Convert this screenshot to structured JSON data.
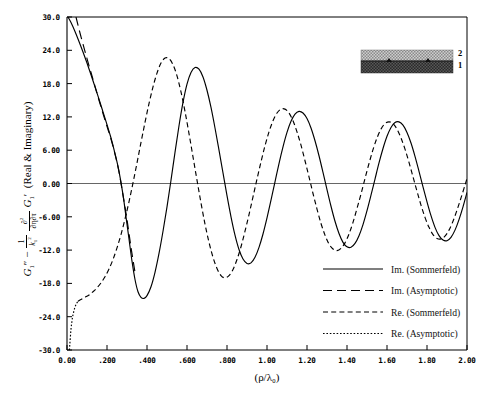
{
  "chart_data": {
    "type": "line",
    "title": "",
    "xlabel": "(ρ/λ₀)",
    "ylabel": "G₁″ − (1/k₁²)(∂²/∂η∂τ) G₁′  (Real & Imaginary)",
    "xlim": [
      0.0,
      2.0
    ],
    "ylim": [
      -30.0,
      30.0
    ],
    "grid": false,
    "legend_position": "lower-right-inside",
    "xticks": [
      "0.00",
      ".200",
      ".400",
      ".600",
      ".800",
      "1.00",
      "1.20",
      "1.40",
      "1.60",
      "1.80",
      "2.00"
    ],
    "xtick_values": [
      0.0,
      0.2,
      0.4,
      0.6,
      0.8,
      1.0,
      1.2,
      1.4,
      1.6,
      1.8,
      2.0
    ],
    "yticks": [
      "30.0",
      "24.0",
      "18.0",
      "12.0",
      "6.00",
      "0.00",
      "-6.00",
      "-12.0",
      "-18.0",
      "-24.0",
      "-30.0"
    ],
    "ytick_values": [
      30.0,
      24.0,
      18.0,
      12.0,
      6.0,
      0.0,
      -6.0,
      -12.0,
      -18.0,
      -24.0,
      -30.0
    ],
    "zero_line": 0.0,
    "series": [
      {
        "name": "Im. (Sommerfeld)",
        "style": "solid",
        "points": [
          [
            0.005,
            30.0
          ],
          [
            0.02,
            29.0
          ],
          [
            0.04,
            27.4
          ],
          [
            0.06,
            25.6
          ],
          [
            0.08,
            23.7
          ],
          [
            0.1,
            21.7
          ],
          [
            0.12,
            19.6
          ],
          [
            0.14,
            17.4
          ],
          [
            0.16,
            15.2
          ],
          [
            0.18,
            12.9
          ],
          [
            0.2,
            10.6
          ],
          [
            0.22,
            8.2
          ],
          [
            0.24,
            5.4
          ],
          [
            0.26,
            2.2
          ],
          [
            0.28,
            -2.0
          ],
          [
            0.295,
            -6.0
          ],
          [
            0.31,
            -10.0
          ],
          [
            0.325,
            -14.0
          ],
          [
            0.34,
            -17.3
          ],
          [
            0.355,
            -19.5
          ],
          [
            0.37,
            -20.5
          ],
          [
            0.385,
            -20.7
          ],
          [
            0.4,
            -20.2
          ],
          [
            0.42,
            -18.6
          ],
          [
            0.44,
            -16.0
          ],
          [
            0.46,
            -12.6
          ],
          [
            0.48,
            -8.6
          ],
          [
            0.5,
            -4.2
          ],
          [
            0.52,
            0.6
          ],
          [
            0.54,
            5.6
          ],
          [
            0.56,
            10.4
          ],
          [
            0.58,
            14.6
          ],
          [
            0.6,
            17.9
          ],
          [
            0.62,
            20.0
          ],
          [
            0.64,
            20.9
          ],
          [
            0.66,
            20.6
          ],
          [
            0.68,
            19.2
          ],
          [
            0.7,
            16.8
          ],
          [
            0.72,
            13.7
          ],
          [
            0.74,
            10.0
          ],
          [
            0.76,
            6.0
          ],
          [
            0.78,
            1.9
          ],
          [
            0.8,
            -2.2
          ],
          [
            0.82,
            -6.0
          ],
          [
            0.84,
            -9.3
          ],
          [
            0.86,
            -11.9
          ],
          [
            0.88,
            -13.6
          ],
          [
            0.9,
            -14.4
          ],
          [
            0.92,
            -14.3
          ],
          [
            0.94,
            -13.3
          ],
          [
            0.96,
            -11.5
          ],
          [
            0.98,
            -9.1
          ],
          [
            1.0,
            -6.2
          ],
          [
            1.02,
            -3.0
          ],
          [
            1.04,
            0.3
          ],
          [
            1.06,
            3.6
          ],
          [
            1.08,
            6.6
          ],
          [
            1.1,
            9.2
          ],
          [
            1.12,
            11.2
          ],
          [
            1.14,
            12.5
          ],
          [
            1.16,
            13.0
          ],
          [
            1.18,
            12.7
          ],
          [
            1.2,
            11.7
          ],
          [
            1.22,
            10.0
          ],
          [
            1.24,
            7.7
          ],
          [
            1.26,
            5.0
          ],
          [
            1.28,
            2.0
          ],
          [
            1.3,
            -1.1
          ],
          [
            1.32,
            -4.1
          ],
          [
            1.34,
            -6.8
          ],
          [
            1.36,
            -9.0
          ],
          [
            1.38,
            -10.6
          ],
          [
            1.4,
            -11.4
          ],
          [
            1.42,
            -11.5
          ],
          [
            1.44,
            -10.8
          ],
          [
            1.46,
            -9.4
          ],
          [
            1.48,
            -7.4
          ],
          [
            1.5,
            -4.9
          ],
          [
            1.52,
            -2.1
          ],
          [
            1.54,
            0.8
          ],
          [
            1.56,
            3.7
          ],
          [
            1.58,
            6.3
          ],
          [
            1.6,
            8.5
          ],
          [
            1.62,
            10.1
          ],
          [
            1.64,
            11.0
          ],
          [
            1.66,
            11.1
          ],
          [
            1.68,
            10.5
          ],
          [
            1.7,
            9.2
          ],
          [
            1.72,
            7.3
          ],
          [
            1.74,
            4.9
          ],
          [
            1.76,
            2.2
          ],
          [
            1.78,
            -0.6
          ],
          [
            1.8,
            -3.3
          ],
          [
            1.82,
            -5.8
          ],
          [
            1.84,
            -7.9
          ],
          [
            1.86,
            -9.4
          ],
          [
            1.88,
            -10.2
          ],
          [
            1.9,
            -10.3
          ],
          [
            1.92,
            -9.7
          ],
          [
            1.94,
            -8.4
          ],
          [
            1.96,
            -6.5
          ],
          [
            1.98,
            -4.2
          ],
          [
            2.0,
            -1.6
          ]
        ]
      },
      {
        "name": "Im. (Asymptotic)",
        "style": "longdash",
        "points": [
          [
            0.045,
            30.0
          ],
          [
            0.06,
            27.8
          ],
          [
            0.08,
            25.1
          ],
          [
            0.1,
            22.5
          ],
          [
            0.12,
            20.0
          ],
          [
            0.14,
            17.5
          ],
          [
            0.16,
            15.0
          ],
          [
            0.18,
            12.6
          ],
          [
            0.2,
            10.3
          ],
          [
            0.22,
            8.0
          ],
          [
            0.24,
            5.3
          ],
          [
            0.26,
            2.1
          ],
          [
            0.28,
            -2.1
          ],
          [
            0.3,
            -6.5
          ],
          [
            0.32,
            -11.5
          ],
          [
            0.34,
            -16.0
          ]
        ]
      },
      {
        "name": "Re. (Sommerfeld)",
        "style": "dash",
        "points": [
          [
            0.055,
            -21.2
          ],
          [
            0.07,
            -20.9
          ],
          [
            0.09,
            -20.5
          ],
          [
            0.11,
            -20.1
          ],
          [
            0.13,
            -19.5
          ],
          [
            0.15,
            -18.8
          ],
          [
            0.17,
            -17.9
          ],
          [
            0.19,
            -16.8
          ],
          [
            0.21,
            -15.4
          ],
          [
            0.23,
            -13.7
          ],
          [
            0.25,
            -11.6
          ],
          [
            0.27,
            -9.2
          ],
          [
            0.29,
            -6.4
          ],
          [
            0.31,
            -3.3
          ],
          [
            0.33,
            0.1
          ],
          [
            0.35,
            3.7
          ],
          [
            0.37,
            7.4
          ],
          [
            0.39,
            11.0
          ],
          [
            0.41,
            14.4
          ],
          [
            0.43,
            17.4
          ],
          [
            0.45,
            19.9
          ],
          [
            0.47,
            21.7
          ],
          [
            0.49,
            22.6
          ],
          [
            0.51,
            22.5
          ],
          [
            0.53,
            21.4
          ],
          [
            0.55,
            19.4
          ],
          [
            0.57,
            16.5
          ],
          [
            0.59,
            13.0
          ],
          [
            0.61,
            9.0
          ],
          [
            0.63,
            4.8
          ],
          [
            0.65,
            0.6
          ],
          [
            0.67,
            -3.5
          ],
          [
            0.69,
            -7.3
          ],
          [
            0.71,
            -10.6
          ],
          [
            0.73,
            -13.3
          ],
          [
            0.75,
            -15.3
          ],
          [
            0.77,
            -16.6
          ],
          [
            0.79,
            -17.0
          ],
          [
            0.81,
            -16.6
          ],
          [
            0.83,
            -15.5
          ],
          [
            0.85,
            -13.7
          ],
          [
            0.87,
            -11.4
          ],
          [
            0.89,
            -8.6
          ],
          [
            0.91,
            -5.6
          ],
          [
            0.93,
            -2.4
          ],
          [
            0.95,
            0.8
          ],
          [
            0.97,
            3.9
          ],
          [
            0.99,
            6.8
          ],
          [
            1.01,
            9.3
          ],
          [
            1.03,
            11.3
          ],
          [
            1.05,
            12.7
          ],
          [
            1.07,
            13.4
          ],
          [
            1.09,
            13.4
          ],
          [
            1.11,
            12.7
          ],
          [
            1.13,
            11.3
          ],
          [
            1.15,
            9.3
          ],
          [
            1.17,
            6.9
          ],
          [
            1.19,
            4.1
          ],
          [
            1.21,
            1.2
          ],
          [
            1.23,
            -1.8
          ],
          [
            1.25,
            -4.6
          ],
          [
            1.27,
            -7.2
          ],
          [
            1.29,
            -9.3
          ],
          [
            1.31,
            -10.9
          ],
          [
            1.33,
            -11.8
          ],
          [
            1.35,
            -12.1
          ],
          [
            1.37,
            -11.7
          ],
          [
            1.39,
            -10.7
          ],
          [
            1.41,
            -9.1
          ],
          [
            1.43,
            -7.0
          ],
          [
            1.45,
            -4.5
          ],
          [
            1.47,
            -1.9
          ],
          [
            1.49,
            0.9
          ],
          [
            1.51,
            3.6
          ],
          [
            1.53,
            6.1
          ],
          [
            1.55,
            8.2
          ],
          [
            1.57,
            9.8
          ],
          [
            1.59,
            10.8
          ],
          [
            1.61,
            11.1
          ],
          [
            1.63,
            10.8
          ],
          [
            1.65,
            9.8
          ],
          [
            1.67,
            8.2
          ],
          [
            1.69,
            6.2
          ],
          [
            1.71,
            3.8
          ],
          [
            1.73,
            1.2
          ],
          [
            1.75,
            -1.4
          ],
          [
            1.77,
            -3.9
          ],
          [
            1.79,
            -6.1
          ],
          [
            1.81,
            -7.9
          ],
          [
            1.83,
            -9.2
          ],
          [
            1.85,
            -9.9
          ],
          [
            1.87,
            -10.0
          ],
          [
            1.89,
            -9.5
          ],
          [
            1.91,
            -8.4
          ],
          [
            1.93,
            -6.8
          ],
          [
            1.95,
            -4.8
          ],
          [
            1.97,
            -2.6
          ],
          [
            1.99,
            -0.3
          ],
          [
            2.0,
            0.9
          ]
        ]
      },
      {
        "name": "Re. (Asymptotic)",
        "style": "dot",
        "points": [
          [
            0.012,
            -30.0
          ],
          [
            0.014,
            -29.0
          ],
          [
            0.017,
            -27.6
          ],
          [
            0.02,
            -26.2
          ],
          [
            0.024,
            -25.0
          ],
          [
            0.028,
            -24.0
          ],
          [
            0.033,
            -23.2
          ],
          [
            0.038,
            -22.5
          ],
          [
            0.044,
            -21.9
          ],
          [
            0.05,
            -21.5
          ],
          [
            0.055,
            -21.2
          ]
        ]
      }
    ]
  },
  "legend": {
    "entries": [
      {
        "label": "Im. (Sommerfeld)",
        "style": "solid"
      },
      {
        "label": "Im. (Asymptotic)",
        "style": "longdash"
      },
      {
        "label": "Re. (Sommerfeld)",
        "style": "dash"
      },
      {
        "label": "Re. (Asymptotic)",
        "style": "dot"
      }
    ]
  },
  "inset": {
    "layers": [
      {
        "name": "upper-layer",
        "label": "2",
        "fill": "#b5b5b5"
      },
      {
        "name": "lower-layer",
        "label": "1",
        "fill": "#303030"
      }
    ]
  },
  "axis_title": {
    "x": "(ρ/λ₀)",
    "y_parts": {
      "g_second": "G",
      "g_second_primes": "″",
      "sub1": "1",
      "minus": "−",
      "frac_num": "1",
      "frac_den": "k",
      "frac_den_sub": "1",
      "frac_den_sup": "2",
      "deriv_num": "∂",
      "deriv_num_sup": "2",
      "deriv_den": "∂η∂τ",
      "g_first": "G",
      "g_first_prime": "′",
      "paren": "(Real & Imaginary)"
    }
  }
}
